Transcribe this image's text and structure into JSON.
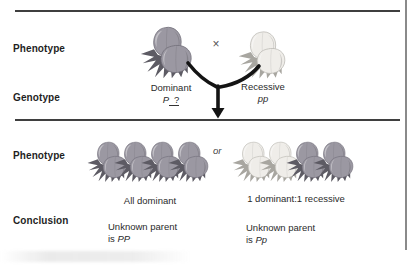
{
  "labels": {
    "phenotype_top": "Phenotype",
    "genotype": "Genotype",
    "phenotype_bottom": "Phenotype",
    "conclusion": "Conclusion"
  },
  "cross": {
    "cross_symbol": "×",
    "dominant_parent": {
      "phenotype": "Dominant",
      "genotype_known": "P",
      "genotype_unknown": "?",
      "variant": "dominant"
    },
    "recessive_parent": {
      "phenotype": "Recessive",
      "genotype": "pp",
      "variant": "recessive"
    }
  },
  "outcomes": {
    "or_label": "or",
    "left": {
      "caption": "All dominant",
      "plants": [
        "dominant",
        "dominant",
        "dominant",
        "dominant"
      ],
      "conclusion_text": "Unknown parent",
      "conclusion_is": "is",
      "conclusion_genotype": "PP"
    },
    "right": {
      "caption": "1 dominant:1 recessive",
      "plants": [
        "recessive",
        "recessive",
        "dominant",
        "dominant"
      ],
      "conclusion_text": "Unknown parent",
      "conclusion_is": "is",
      "conclusion_genotype": "Pp"
    }
  },
  "colors": {
    "dominant_pod": "#9b98a2",
    "dominant_spike": "#5d5b64",
    "dominant_edge": "#6f6c77",
    "recessive_pod": "#efede9",
    "recessive_spike": "#a8a6a0",
    "recessive_edge": "#b5b3ad",
    "rule_line": "#3f3f3f",
    "border_line": "#8a8a8a",
    "arrow": "#141414",
    "text": "#1f1f1f"
  }
}
